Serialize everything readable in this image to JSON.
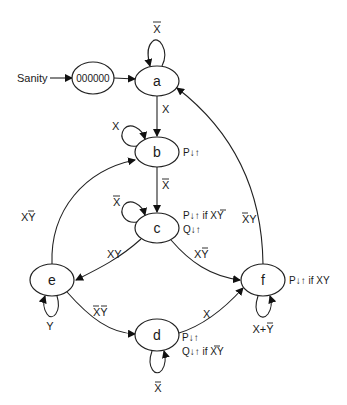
{
  "diagram": {
    "type": "state-machine",
    "entry_label": "Sanity",
    "initial_state": "000000",
    "states": [
      {
        "id": "a",
        "label": "a",
        "output": ""
      },
      {
        "id": "b",
        "label": "b",
        "output": "P↓↑"
      },
      {
        "id": "c",
        "label": "c",
        "output_line1": "P↓↑ if X̄Y",
        "output_line2": "Q↓↑"
      },
      {
        "id": "d",
        "label": "d",
        "output_line1": "P↓↑",
        "output_line2": "Q↓↑ if X̄Y"
      },
      {
        "id": "e",
        "label": "e",
        "output": ""
      },
      {
        "id": "f",
        "label": "f",
        "output": "P↓↑ if XY"
      }
    ],
    "transitions": [
      {
        "from": "Sanity",
        "to": "000000",
        "label": ""
      },
      {
        "from": "000000",
        "to": "a",
        "label": ""
      },
      {
        "from": "a",
        "to": "a",
        "label": "X̄"
      },
      {
        "from": "a",
        "to": "b",
        "label": "X"
      },
      {
        "from": "b",
        "to": "b",
        "label": "X"
      },
      {
        "from": "b",
        "to": "c",
        "label": "X̄"
      },
      {
        "from": "c",
        "to": "c",
        "label": "X̄"
      },
      {
        "from": "c",
        "to": "e",
        "label": "XY"
      },
      {
        "from": "c",
        "to": "f",
        "label": "XȲ"
      },
      {
        "from": "e",
        "to": "b",
        "label": "XȲ"
      },
      {
        "from": "e",
        "to": "e",
        "label": "Y"
      },
      {
        "from": "e",
        "to": "d",
        "label": "X̄Ȳ"
      },
      {
        "from": "d",
        "to": "d",
        "label": "X̄"
      },
      {
        "from": "d",
        "to": "f",
        "label": "X"
      },
      {
        "from": "f",
        "to": "f",
        "label": "X+Ȳ"
      },
      {
        "from": "f",
        "to": "a",
        "label": "X̄Y"
      }
    ]
  },
  "labels": {
    "sanity": "Sanity",
    "init": "000000",
    "a": "a",
    "b": "b",
    "c": "c",
    "d": "d",
    "e": "e",
    "f": "f",
    "a_self": "X",
    "a_to_b": "X",
    "b_self": "X",
    "b_out": "P↓↑",
    "b_to_c": "X",
    "c_self": "X",
    "c_out1_pre": "P↓↑ if ",
    "c_out1_var": "XY",
    "c_out2": "Q↓↑",
    "c_to_e": "XY",
    "c_to_f": "XY",
    "e_to_b": "XY",
    "e_self": "Y",
    "e_to_d": "XY",
    "d_self": "X",
    "d_out1": "P↓↑",
    "d_out2_pre": "Q↓↑ if ",
    "d_out2_var": "XY",
    "d_to_f": "X",
    "f_self": "X+Y",
    "f_out": "P↓↑ if XY",
    "f_to_a": "XY"
  }
}
